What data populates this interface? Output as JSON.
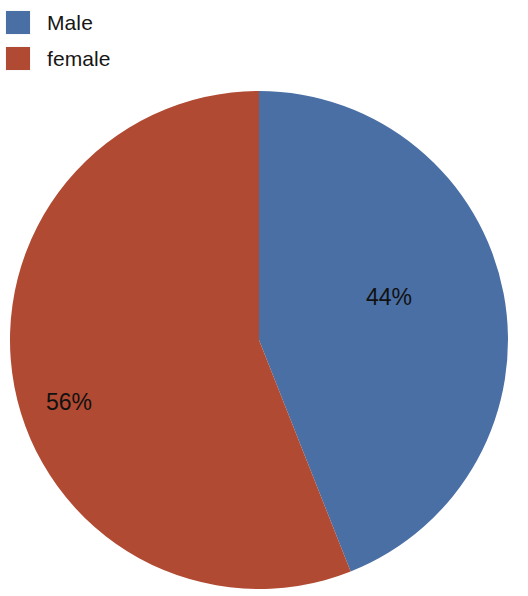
{
  "legend": {
    "items": [
      {
        "label": "Male",
        "color": "#4a6fa5",
        "swatch_name": "legend-swatch-male"
      },
      {
        "label": "female",
        "color": "#b04a32",
        "swatch_name": "legend-swatch-female"
      }
    ]
  },
  "labels": {
    "male_percent": "44%",
    "female_percent": "56%"
  },
  "chart_data": {
    "type": "pie",
    "title": "",
    "categories": [
      "Male",
      "female"
    ],
    "values": [
      44,
      56
    ],
    "value_labels": [
      "44%",
      "56%"
    ],
    "colors": [
      "#4a6fa5",
      "#b04a32"
    ],
    "legend_position": "top-left",
    "start_angle_deg": 0,
    "direction": "clockwise",
    "grid": false,
    "units": "percent"
  }
}
